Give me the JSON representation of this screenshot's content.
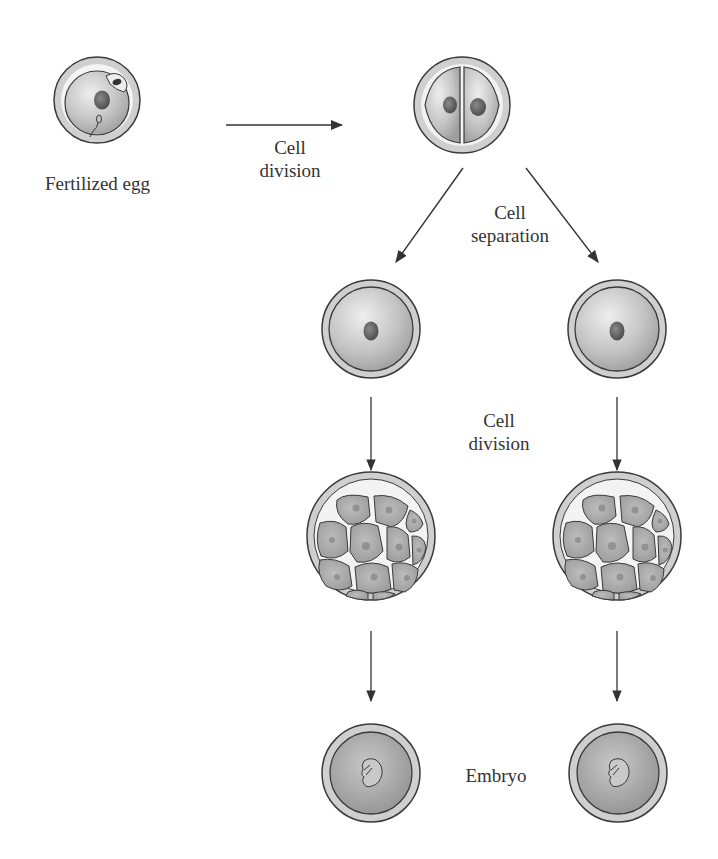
{
  "diagram": {
    "type": "process-flow",
    "colors": {
      "outline": "#3a3a3a",
      "zona": "#c9c9c9",
      "cytoplasm_light": "#e6e6e6",
      "cytoplasm_dark": "#a8a8a8",
      "nucleus": "#6a6a6a",
      "arrow": "#333333",
      "text": "#333333"
    },
    "labels": {
      "fertilized_egg": "Fertilized egg",
      "cell_division_1_line1": "Cell",
      "cell_division_1_line2": "division",
      "cell_separation_line1": "Cell",
      "cell_separation_line2": "separation",
      "cell_division_2_line1": "Cell",
      "cell_division_2_line2": "division",
      "embryo": "Embryo"
    },
    "nodes": [
      {
        "id": "fertilized-egg",
        "label": "Fertilized egg",
        "cx": 97,
        "cy": 100
      },
      {
        "id": "two-cell-stage",
        "cx": 462,
        "cy": 105
      },
      {
        "id": "left-single-cell",
        "cx": 371,
        "cy": 329
      },
      {
        "id": "right-single-cell",
        "cx": 617,
        "cy": 329
      },
      {
        "id": "left-morula",
        "cx": 371,
        "cy": 536
      },
      {
        "id": "right-morula",
        "cx": 617,
        "cy": 536
      },
      {
        "id": "left-embryo",
        "label": "Embryo",
        "cx": 371,
        "cy": 773
      },
      {
        "id": "right-embryo",
        "label": "Embryo",
        "cx": 618,
        "cy": 773
      }
    ],
    "edges": [
      {
        "from": "fertilized-egg",
        "to": "two-cell-stage",
        "label": "Cell division"
      },
      {
        "from": "two-cell-stage",
        "to": "left-single-cell",
        "label": "Cell separation"
      },
      {
        "from": "two-cell-stage",
        "to": "right-single-cell",
        "label": "Cell separation"
      },
      {
        "from": "left-single-cell",
        "to": "left-morula",
        "label": "Cell division"
      },
      {
        "from": "right-single-cell",
        "to": "right-morula",
        "label": "Cell division"
      },
      {
        "from": "left-morula",
        "to": "left-embryo"
      },
      {
        "from": "right-morula",
        "to": "right-embryo"
      }
    ]
  }
}
